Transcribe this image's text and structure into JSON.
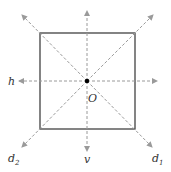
{
  "diagram": {
    "labels": {
      "h": "h",
      "v": "v",
      "d1": "d",
      "d1_sub": "1",
      "d2": "d",
      "d2_sub": "2",
      "center": "O"
    },
    "colors": {
      "square": "#333333",
      "axes": "#9a9a9a",
      "center_dot": "#000000",
      "text": "#333333"
    },
    "square": {
      "x": 40,
      "y": 33,
      "size": 95
    },
    "center": {
      "x": 87,
      "y": 81
    }
  }
}
